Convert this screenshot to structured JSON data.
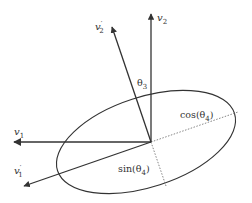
{
  "diagram": {
    "colors": {
      "line": "#333333",
      "dotted": "#777777",
      "background": "#ffffff"
    },
    "vectors": [
      {
        "id": "v1",
        "base": "v",
        "sub": "1",
        "prime": false
      },
      {
        "id": "v2",
        "base": "v",
        "sub": "2",
        "prime": false
      },
      {
        "id": "v1p",
        "base": "v",
        "sub": "1",
        "prime": true
      },
      {
        "id": "v2p",
        "base": "v",
        "sub": "2",
        "prime": true
      }
    ],
    "labels": {
      "v1": {
        "base": "v",
        "sub": "1"
      },
      "v2": {
        "base": "v",
        "sub": "2"
      },
      "v1p": {
        "base": "v",
        "prime": "′",
        "sub": "1"
      },
      "v2p": {
        "base": "v",
        "prime": "′",
        "sub": "2"
      },
      "theta3": {
        "base": "θ",
        "sub": "3"
      },
      "cos": {
        "prefix": "cos(θ",
        "sub": "4",
        "suffix": ")"
      },
      "sin": {
        "prefix": "sin(θ",
        "sub": "4",
        "suffix": ")"
      }
    },
    "shapes": {
      "ellipse": "tilted-ellipse",
      "dotted_lines": [
        "cos-projection",
        "sin-projection"
      ]
    }
  }
}
